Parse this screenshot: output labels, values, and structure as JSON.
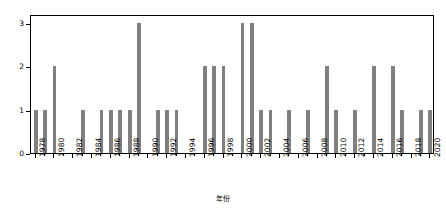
{
  "chart_data": {
    "type": "bar",
    "title": "",
    "xlabel": "年份",
    "ylabel": "过程次数",
    "xlim": [
      1977.5,
      2020.5
    ],
    "ylim": [
      0,
      3.2
    ],
    "yticks": [
      0,
      1,
      2,
      3
    ],
    "ytick_labels": [
      "0",
      "1",
      "2",
      "3"
    ],
    "xtick_labels": [
      "1978",
      "1980",
      "1982",
      "1984",
      "1986",
      "1988",
      "1990",
      "1992",
      "1994",
      "1996",
      "1998",
      "2000",
      "2002",
      "2004",
      "2006",
      "2008",
      "2010",
      "2012",
      "2014",
      "2016",
      "2018",
      "2020"
    ],
    "xtick_values": [
      1978,
      1980,
      1982,
      1984,
      1986,
      1988,
      1990,
      1992,
      1994,
      1996,
      1998,
      2000,
      2002,
      2004,
      2006,
      2008,
      2010,
      2012,
      2014,
      2016,
      2018,
      2020
    ],
    "minor_ticks_every": 1,
    "grid": false,
    "legend": null,
    "bar_color": "#808080",
    "frame_color": "#000000",
    "categories": [
      1978,
      1979,
      1980,
      1981,
      1982,
      1983,
      1984,
      1985,
      1986,
      1987,
      1988,
      1989,
      1990,
      1991,
      1992,
      1993,
      1994,
      1995,
      1996,
      1997,
      1998,
      1999,
      2000,
      2001,
      2002,
      2003,
      2004,
      2005,
      2006,
      2007,
      2008,
      2009,
      2010,
      2011,
      2012,
      2013,
      2014,
      2015,
      2016,
      2017,
      2018,
      2019,
      2020
    ],
    "values": [
      1,
      1,
      2,
      0,
      0,
      1,
      0,
      1,
      1,
      1,
      1,
      3,
      0,
      1,
      1,
      1,
      0,
      0,
      2,
      2,
      2,
      0,
      3,
      3,
      1,
      1,
      0,
      1,
      0,
      1,
      0,
      2,
      1,
      0,
      1,
      0,
      2,
      0,
      2,
      1,
      0,
      1,
      1
    ]
  }
}
